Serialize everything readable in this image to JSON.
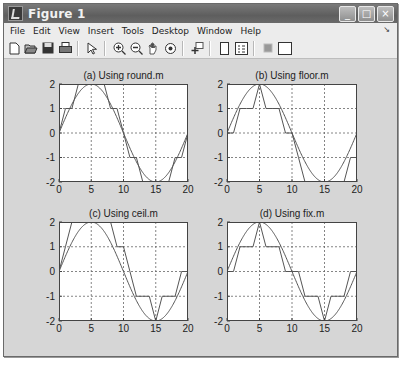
{
  "window": {
    "title": "Figure 1",
    "controls": {
      "minimize": "_",
      "maximize": "□",
      "close": "×"
    }
  },
  "menubar": {
    "items": [
      "File",
      "Edit",
      "View",
      "Insert",
      "Tools",
      "Desktop",
      "Window",
      "Help"
    ],
    "overflow_arrow": "↘"
  },
  "toolbar": {
    "buttons": [
      {
        "name": "new-figure",
        "glyph": "🗋"
      },
      {
        "name": "open-file",
        "glyph": "📂"
      },
      {
        "name": "save-figure",
        "glyph": "💾"
      },
      {
        "name": "print-figure",
        "glyph": "🖶"
      },
      {
        "name": "edit-plot",
        "glyph": "↖"
      },
      {
        "name": "zoom-in",
        "glyph": "⊕"
      },
      {
        "name": "zoom-out",
        "glyph": "⊖"
      },
      {
        "name": "pan",
        "glyph": "✋"
      },
      {
        "name": "rotate-3d",
        "glyph": "⟳"
      },
      {
        "name": "data-cursor",
        "glyph": "✚"
      },
      {
        "name": "colorbar",
        "glyph": "▯"
      },
      {
        "name": "legend",
        "glyph": "☷"
      },
      {
        "name": "hide-plot-tools",
        "glyph": "▪"
      },
      {
        "name": "show-plot-tools",
        "glyph": "▢"
      }
    ]
  },
  "colors": {
    "figure_bg": "#d6d6d6",
    "axes_bg": "#ffffff",
    "line": "#555555",
    "grid": "#666666"
  },
  "chart_data": [
    {
      "type": "line",
      "title": "(a) Using round.m",
      "xlim": [
        0,
        20
      ],
      "ylim": [
        -2,
        2
      ],
      "xticks": [
        0,
        5,
        10,
        15,
        20
      ],
      "yticks": [
        -2,
        -1,
        0,
        1,
        2
      ],
      "grid": true,
      "series": [
        {
          "name": "2*sin(pi*x/10)",
          "smooth": true
        },
        {
          "name": "round",
          "x": [
            0,
            1,
            2,
            3,
            4,
            5,
            6,
            7,
            8,
            9,
            10,
            11,
            12,
            13,
            14,
            15,
            16,
            17,
            18,
            19,
            20
          ],
          "values": [
            0,
            1,
            1,
            2,
            2,
            2,
            2,
            2,
            1,
            1,
            0,
            -1,
            -1,
            -2,
            -2,
            -2,
            -2,
            -2,
            -1,
            -1,
            0
          ]
        }
      ]
    },
    {
      "type": "line",
      "title": "(b) Using floor.m",
      "xlim": [
        0,
        20
      ],
      "ylim": [
        -2,
        2
      ],
      "xticks": [
        0,
        5,
        10,
        15,
        20
      ],
      "yticks": [
        -2,
        -1,
        0,
        1,
        2
      ],
      "grid": true,
      "series": [
        {
          "name": "2*sin(pi*x/10)",
          "smooth": true
        },
        {
          "name": "floor",
          "x": [
            0,
            1,
            2,
            3,
            4,
            5,
            6,
            7,
            8,
            9,
            10,
            11,
            12,
            13,
            14,
            15,
            16,
            17,
            18,
            19,
            20
          ],
          "values": [
            0,
            0,
            1,
            1,
            1,
            2,
            1,
            1,
            1,
            0,
            0,
            -1,
            -2,
            -2,
            -2,
            -2,
            -2,
            -2,
            -2,
            -1,
            -1
          ]
        }
      ]
    },
    {
      "type": "line",
      "title": "(c) Using ceil.m",
      "xlim": [
        0,
        20
      ],
      "ylim": [
        -2,
        2
      ],
      "xticks": [
        0,
        5,
        10,
        15,
        20
      ],
      "yticks": [
        -2,
        -1,
        0,
        1,
        2
      ],
      "grid": true,
      "series": [
        {
          "name": "2*sin(pi*x/10)",
          "smooth": true
        },
        {
          "name": "ceil",
          "x": [
            0,
            1,
            2,
            3,
            4,
            5,
            6,
            7,
            8,
            9,
            10,
            11,
            12,
            13,
            14,
            15,
            16,
            17,
            18,
            19,
            20
          ],
          "values": [
            0,
            1,
            2,
            2,
            2,
            2,
            2,
            2,
            2,
            1,
            1,
            0,
            -1,
            -1,
            -1,
            -2,
            -1,
            -1,
            -1,
            0,
            0
          ]
        }
      ]
    },
    {
      "type": "line",
      "title": "(d) Using fix.m",
      "xlim": [
        0,
        20
      ],
      "ylim": [
        -2,
        2
      ],
      "xticks": [
        0,
        5,
        10,
        15,
        20
      ],
      "yticks": [
        -2,
        -1,
        0,
        1,
        2
      ],
      "grid": true,
      "series": [
        {
          "name": "2*sin(pi*x/10)",
          "smooth": true
        },
        {
          "name": "fix",
          "x": [
            0,
            1,
            2,
            3,
            4,
            5,
            6,
            7,
            8,
            9,
            10,
            11,
            12,
            13,
            14,
            15,
            16,
            17,
            18,
            19,
            20
          ],
          "values": [
            0,
            0,
            1,
            1,
            1,
            2,
            1,
            1,
            1,
            0,
            0,
            0,
            -1,
            -1,
            -1,
            -2,
            -1,
            -1,
            -1,
            0,
            0
          ]
        }
      ]
    }
  ]
}
